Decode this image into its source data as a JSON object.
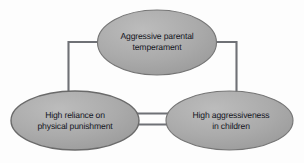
{
  "diagram": {
    "type": "cyclical-influence-diagram",
    "background_color": "#fdfdfd",
    "node_fill_color": "#a8a8a8",
    "node_stroke_color": "#6e6e6e",
    "connector_color": "#6f7176",
    "text_color": "#15161f",
    "nodes": [
      {
        "id": "aggressive-parental-temperament",
        "label": "Aggressive parental\ntemperament",
        "shape": "ellipse",
        "position": "top-center"
      },
      {
        "id": "high-reliance-on-physical-punishment",
        "label": "High reliance on\nphysical punishment",
        "shape": "ellipse",
        "position": "bottom-left"
      },
      {
        "id": "high-aggressiveness-in-children",
        "label": "High aggressiveness\nin children",
        "shape": "ellipse",
        "position": "bottom-right"
      }
    ],
    "connectors": [
      {
        "id": "top-to-left",
        "from": "aggressive-parental-temperament",
        "to": "high-reliance-on-physical-punishment",
        "style": "elbow",
        "arrowheads": "end"
      },
      {
        "id": "top-to-right",
        "from": "aggressive-parental-temperament",
        "to": "high-aggressiveness-in-children",
        "style": "elbow",
        "arrowheads": "end"
      },
      {
        "id": "left-to-right",
        "from": "high-reliance-on-physical-punishment",
        "to": "high-aggressiveness-in-children",
        "style": "straight",
        "arrowheads": "end"
      },
      {
        "id": "right-to-left",
        "from": "high-aggressiveness-in-children",
        "to": "high-reliance-on-physical-punishment",
        "style": "straight",
        "arrowheads": "end"
      }
    ]
  }
}
